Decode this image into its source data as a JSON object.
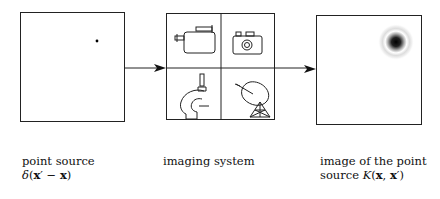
{
  "panels": {
    "source": {
      "label_line1": "point source",
      "formula": {
        "delta": "δ",
        "open": "(",
        "xp": "x",
        "prime": "′",
        "minus": " − ",
        "x": "x",
        "close": ")"
      }
    },
    "system": {
      "label_line1": "imaging system",
      "icons": [
        "video-camera-icon",
        "photo-camera-icon",
        "microscope-icon",
        "satellite-dish-icon"
      ]
    },
    "image": {
      "label_line1": "image of the point",
      "label_line2_prefix": "source ",
      "formula": {
        "K": "K",
        "open": "(",
        "x": "x",
        "comma": ", ",
        "xp": "x",
        "prime": "′",
        "close": ")"
      }
    }
  },
  "colors": {
    "stroke": "#222222",
    "psf": "#000000"
  }
}
